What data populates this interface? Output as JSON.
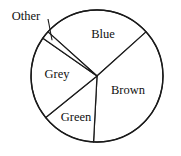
{
  "chart_data": {
    "type": "pie",
    "title": "",
    "subtitle": "",
    "xlabel": "",
    "ylabel": "",
    "legend_position": "none",
    "grid": false,
    "labels_inside": true,
    "categories": [
      "Blue",
      "Brown",
      "Green",
      "Grey",
      "Other"
    ],
    "values": [
      25,
      37,
      13,
      23,
      2
    ],
    "slices": [
      {
        "name": "Blue",
        "label": "Blue",
        "value": 25,
        "percent": 25,
        "start_angle_deg": 312,
        "end_angle_deg": 48,
        "label_x": 103,
        "label_y": 35,
        "callout": false
      },
      {
        "name": "Brown",
        "label": "Brown",
        "value": 37,
        "percent": 37,
        "start_angle_deg": 48,
        "end_angle_deg": 183,
        "label_x": 128,
        "label_y": 91,
        "callout": false
      },
      {
        "name": "Green",
        "label": "Green",
        "value": 13,
        "percent": 13,
        "start_angle_deg": 183,
        "end_angle_deg": 231,
        "label_x": 76,
        "label_y": 118,
        "callout": false
      },
      {
        "name": "Grey",
        "label": "Grey",
        "value": 23,
        "percent": 23,
        "start_angle_deg": 231,
        "end_angle_deg": 305,
        "label_x": 57,
        "label_y": 75,
        "callout": false
      },
      {
        "name": "Other",
        "label": "Other",
        "value": 2,
        "percent": 2,
        "start_angle_deg": 305,
        "end_angle_deg": 312,
        "label_x": 26,
        "label_y": 17,
        "callout": true
      }
    ],
    "geometry": {
      "center_x": 97,
      "center_y": 76,
      "radius": 66
    },
    "colors": {
      "slice_fill": "#ffffff",
      "outline": "#1a1a1a",
      "text": "#111111",
      "background": "#ffffff"
    }
  }
}
